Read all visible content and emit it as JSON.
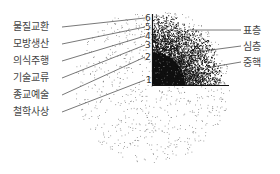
{
  "diagram": {
    "left_labels": [
      {
        "text": "물질교환",
        "level": "6"
      },
      {
        "text": "모방생산",
        "level": "5"
      },
      {
        "text": "의식주행",
        "level": "4"
      },
      {
        "text": "기술교류",
        "level": "3"
      },
      {
        "text": "종교예술",
        "level": "2"
      },
      {
        "text": "철학사상",
        "level": "1"
      }
    ],
    "axis_numbers": [
      "6",
      "5",
      "4",
      "3",
      "2",
      "1"
    ],
    "right_labels": [
      {
        "text": "표층"
      },
      {
        "text": "심층"
      },
      {
        "text": "중핵"
      }
    ],
    "colors": {
      "ink": "#111111",
      "label": "#444444",
      "line": "#555555"
    }
  }
}
